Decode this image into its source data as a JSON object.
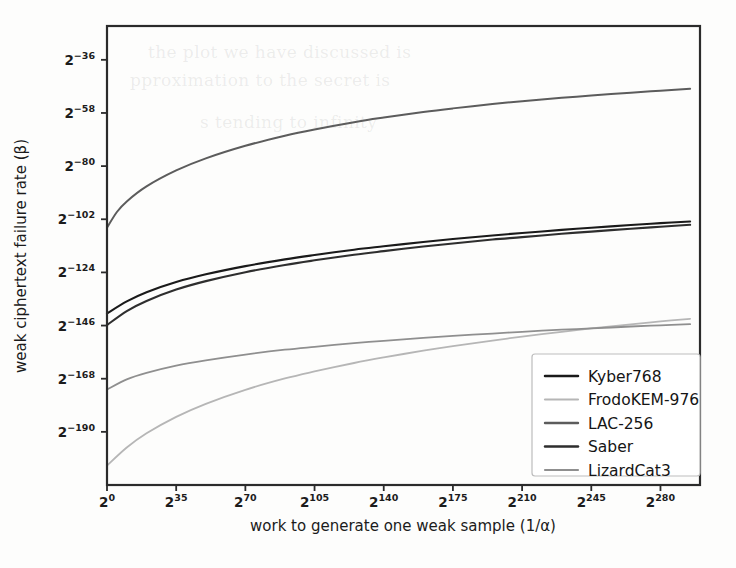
{
  "chart_data": {
    "type": "line",
    "title": "",
    "xlabel": "work to generate one weak sample (1/α)",
    "ylabel": "weak ciphertext failure rate (β)",
    "x_tick_labels": [
      "2^0",
      "2^35",
      "2^70",
      "2^105",
      "2^140",
      "2^175",
      "2^210",
      "2^245",
      "2^280"
    ],
    "x_tick_bases": [
      "2",
      "2",
      "2",
      "2",
      "2",
      "2",
      "2",
      "2",
      "2"
    ],
    "x_tick_exponents": [
      "0",
      "35",
      "70",
      "105",
      "140",
      "175",
      "210",
      "245",
      "280"
    ],
    "y_tick_labels": [
      "2^-36",
      "2^-58",
      "2^-80",
      "2^-102",
      "2^-124",
      "2^-146",
      "2^-168",
      "2^-190"
    ],
    "y_tick_bases": [
      "2",
      "2",
      "2",
      "2",
      "2",
      "2",
      "2",
      "2"
    ],
    "y_tick_exponents": [
      "−36",
      "−58",
      "−80",
      "−102",
      "−124",
      "−146",
      "−168",
      "−190"
    ],
    "xlim_exponent": [
      0,
      300
    ],
    "ylim_exponent": [
      -212,
      -22
    ],
    "x_axis_note": "x is log2 of work; tick exponents step by 35",
    "y_axis_note": "y is log2 of failure rate; tick exponents step by 22",
    "grid": false,
    "legend_position": "lower right",
    "series": [
      {
        "name": "Kyber768",
        "color": "#1a1a1a",
        "linewidth": 2.1,
        "x_exponents": [
          0,
          10,
          20,
          35,
          50,
          70,
          90,
          105,
          125,
          140,
          160,
          175,
          195,
          210,
          230,
          245,
          265,
          280,
          295
        ],
        "y_exponents": [
          -141.0,
          -136.0,
          -132.2,
          -128.0,
          -124.8,
          -121.4,
          -118.6,
          -116.8,
          -114.6,
          -113.2,
          -111.4,
          -110.2,
          -108.7,
          -107.7,
          -106.4,
          -105.5,
          -104.4,
          -103.6,
          -102.9
        ]
      },
      {
        "name": "FrodoKEM-976",
        "color": "#b6b6b6",
        "linewidth": 1.8,
        "x_exponents": [
          0,
          10,
          20,
          35,
          50,
          70,
          90,
          105,
          125,
          140,
          160,
          175,
          195,
          210,
          230,
          245,
          265,
          280,
          295
        ],
        "y_exponents": [
          -204.0,
          -196.5,
          -190.6,
          -183.8,
          -178.4,
          -172.6,
          -167.9,
          -165.0,
          -161.5,
          -159.2,
          -156.4,
          -154.5,
          -152.2,
          -150.6,
          -148.6,
          -147.2,
          -145.5,
          -144.3,
          -143.2
        ]
      },
      {
        "name": "LAC-256",
        "color": "#5c5c5c",
        "linewidth": 2.0,
        "x_exponents": [
          0,
          5,
          10,
          20,
          35,
          50,
          70,
          90,
          105,
          125,
          140,
          160,
          175,
          195,
          210,
          230,
          245,
          265,
          280,
          295
        ],
        "y_exponents": [
          -105.5,
          -99.0,
          -94.6,
          -88.4,
          -81.8,
          -76.8,
          -71.6,
          -67.4,
          -64.8,
          -61.8,
          -59.9,
          -57.6,
          -56.1,
          -54.3,
          -53.1,
          -51.7,
          -50.8,
          -49.6,
          -48.8,
          -48.0
        ]
      },
      {
        "name": "Saber",
        "color": "#2e2e2e",
        "linewidth": 2.1,
        "x_exponents": [
          0,
          10,
          20,
          35,
          50,
          70,
          90,
          105,
          125,
          140,
          160,
          175,
          195,
          210,
          230,
          245,
          265,
          280,
          295
        ],
        "y_exponents": [
          -145.8,
          -140.0,
          -135.8,
          -131.1,
          -127.6,
          -123.9,
          -120.9,
          -119.0,
          -116.7,
          -115.2,
          -113.3,
          -112.0,
          -110.4,
          -109.4,
          -108.0,
          -107.1,
          -105.9,
          -105.1,
          -104.3
        ]
      },
      {
        "name": "LizardCat3",
        "color": "#8f8f8f",
        "linewidth": 1.8,
        "x_exponents": [
          0,
          10,
          20,
          35,
          50,
          70,
          90,
          105,
          125,
          140,
          160,
          175,
          195,
          210,
          230,
          245,
          265,
          280,
          295
        ],
        "y_exponents": [
          -172.5,
          -168.3,
          -165.6,
          -162.6,
          -160.4,
          -158.0,
          -156.0,
          -154.8,
          -153.3,
          -152.3,
          -151.1,
          -150.3,
          -149.3,
          -148.6,
          -147.7,
          -147.2,
          -146.4,
          -145.9,
          -145.4
        ]
      }
    ]
  },
  "legend": {
    "entries": [
      {
        "label": "Kyber768"
      },
      {
        "label": "FrodoKEM-976"
      },
      {
        "label": "LAC-256"
      },
      {
        "label": "Saber"
      },
      {
        "label": "LizardCat3"
      }
    ]
  },
  "background_bleed": {
    "lines": [
      "the plot we have discussed is",
      "pproximation to the secret is",
      "s tending to infinity"
    ]
  }
}
